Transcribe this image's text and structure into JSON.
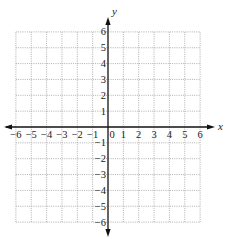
{
  "chart_data": {
    "type": "scatter",
    "title": "",
    "xlabel": "x",
    "ylabel": "y",
    "xlim": [
      -6,
      6
    ],
    "ylim": [
      -6,
      6
    ],
    "grid": true,
    "grid_style": "dotted",
    "x_ticks": [
      -6,
      -5,
      -4,
      -3,
      -2,
      -1,
      0,
      1,
      2,
      3,
      4,
      5,
      6
    ],
    "y_ticks": [
      -6,
      -5,
      -4,
      -3,
      -2,
      -1,
      1,
      2,
      3,
      4,
      5,
      6
    ],
    "x_tick_labels": [
      "−6",
      "−5",
      "−4",
      "−3",
      "−2",
      "−1",
      "0",
      "1",
      "2",
      "3",
      "4",
      "5",
      "6"
    ],
    "y_tick_labels": [
      "−6",
      "−5",
      "−4",
      "−3",
      "−2",
      "−1",
      "1",
      "2",
      "3",
      "4",
      "5",
      "6"
    ],
    "series": [],
    "legend": null
  },
  "colors": {
    "axis": "#111111",
    "grid": "#9a9a9a",
    "text": "#222222",
    "background": "#ffffff"
  }
}
